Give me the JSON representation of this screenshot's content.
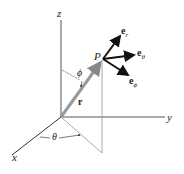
{
  "diagram": {
    "axes": {
      "x": "x",
      "y": "y",
      "z": "z"
    },
    "point": "P",
    "position_vector": "r",
    "angles": {
      "polar": "ϕ",
      "azimuthal": "θ"
    },
    "unit_vectors": [
      {
        "base": "e",
        "sub": "r"
      },
      {
        "base": "e",
        "sub": "θ"
      },
      {
        "base": "e",
        "sub": "ϕ"
      }
    ],
    "colors": {
      "axes": "#444444",
      "vector_r": "#999999",
      "unit_vectors": "#111111",
      "projection": "#aaaaaa"
    }
  }
}
